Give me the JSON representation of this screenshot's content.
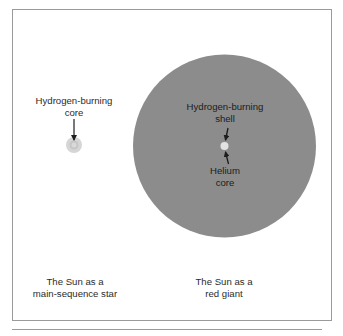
{
  "main_sequence": {
    "core_label_line1": "Hydrogen-burning",
    "core_label_line2": "core",
    "caption_line1": "The Sun as a",
    "caption_line2": "main-sequence star",
    "outer_color": "#d6d6d6",
    "core_color": "#c4c4c4"
  },
  "red_giant": {
    "shell_label_line1": "Hydrogen-burning",
    "shell_label_line2": "shell",
    "core_label_line1": "Helium",
    "core_label_line2": "core",
    "caption_line1": "The Sun as a",
    "caption_line2": "red giant",
    "body_color": "#8c8c8c",
    "core_color": "#e2e2e2"
  },
  "colors": {
    "frame": "#9a9a9a",
    "arrow": "#1e1e1e",
    "text": "#2b2b2b"
  }
}
